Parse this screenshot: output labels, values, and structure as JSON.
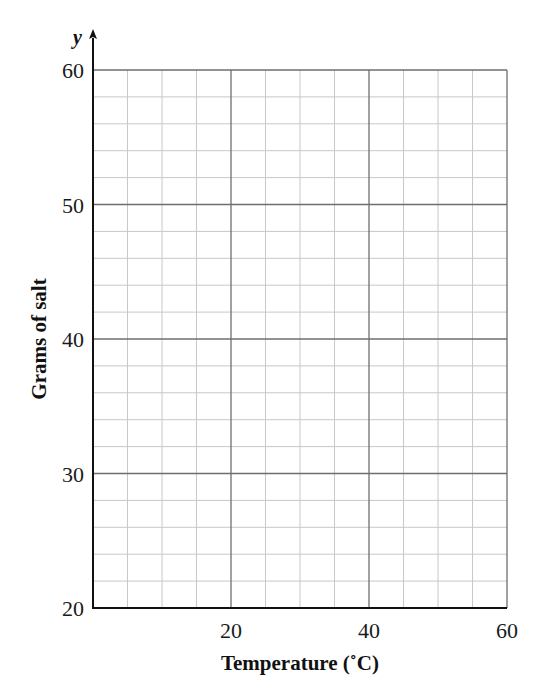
{
  "chart_data": {
    "type": "line",
    "title": "",
    "xlabel": "Temperature (˚C)",
    "ylabel": "Grams of salt",
    "y_axis_letter": "y",
    "xlim": [
      0,
      60
    ],
    "ylim": [
      20,
      60
    ],
    "x_ticks": [
      "20",
      "40",
      "60"
    ],
    "y_ticks": [
      "20",
      "30",
      "40",
      "50",
      "60"
    ],
    "x_major_step": 20,
    "x_minor_step": 5,
    "y_major_step": 10,
    "y_minor_step": 2,
    "grid": true,
    "series": []
  },
  "colors": {
    "axis": "#111111",
    "major_grid": "#6e6e6e",
    "minor_grid": "#c8c8c8"
  }
}
